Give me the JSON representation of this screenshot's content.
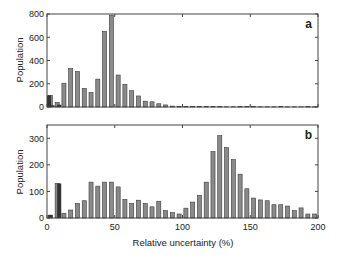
{
  "chart_data": [
    {
      "type": "bar",
      "panel_label": "a",
      "title": "",
      "xlabel": "",
      "ylabel": "Population",
      "xlim": [
        0,
        200
      ],
      "ylim": [
        0,
        800
      ],
      "yticks": [
        0,
        200,
        400,
        600,
        800
      ],
      "xticks": [
        0,
        50,
        100,
        150,
        200
      ],
      "show_xtick_labels": false,
      "grid": false,
      "bin_width": 5,
      "x": [
        0,
        5,
        10,
        15,
        20,
        25,
        30,
        35,
        40,
        45,
        50,
        55,
        60,
        65,
        70,
        75,
        80,
        85,
        90,
        95,
        100,
        105,
        110,
        115,
        120,
        125,
        130,
        135,
        140,
        145,
        150,
        155,
        160,
        165,
        170,
        175,
        180,
        185,
        190,
        195
      ],
      "values": [
        100,
        40,
        205,
        330,
        305,
        160,
        125,
        240,
        650,
        790,
        275,
        195,
        140,
        95,
        50,
        45,
        28,
        18,
        8,
        5,
        4,
        3,
        4,
        3,
        6,
        3,
        2,
        2,
        3,
        5,
        3,
        2,
        2,
        2,
        3,
        2,
        2,
        2,
        4,
        2
      ],
      "dark_bars": [
        {
          "x": 0,
          "value": 100
        },
        {
          "x": 2.5,
          "value": 15
        },
        {
          "x": 7.5,
          "value": 20
        }
      ]
    },
    {
      "type": "bar",
      "panel_label": "b",
      "title": "",
      "xlabel": "Relative uncertainty (%)",
      "ylabel": "Population",
      "xlim": [
        0,
        200
      ],
      "ylim": [
        0,
        350
      ],
      "yticks": [
        0,
        100,
        200,
        300
      ],
      "xticks": [
        0,
        50,
        100,
        150,
        200
      ],
      "show_xtick_labels": true,
      "grid": false,
      "bin_width": 5,
      "x": [
        0,
        5,
        10,
        15,
        20,
        25,
        30,
        35,
        40,
        45,
        50,
        55,
        60,
        65,
        70,
        75,
        80,
        85,
        90,
        95,
        100,
        105,
        110,
        115,
        120,
        125,
        130,
        135,
        140,
        145,
        150,
        155,
        160,
        165,
        170,
        175,
        180,
        185,
        190,
        195
      ],
      "values": [
        10,
        130,
        18,
        30,
        55,
        65,
        135,
        120,
        135,
        135,
        117,
        70,
        55,
        67,
        55,
        42,
        63,
        28,
        20,
        15,
        37,
        60,
        85,
        135,
        250,
        310,
        265,
        220,
        165,
        110,
        75,
        68,
        65,
        50,
        50,
        45,
        28,
        38,
        15,
        15
      ],
      "dark_bars": [
        {
          "x": 1,
          "value": 12
        },
        {
          "x": 7.5,
          "value": 130
        }
      ]
    }
  ],
  "panels": {
    "a": {
      "label": "a",
      "ylabel": "Population",
      "yticks": [
        "0",
        "200",
        "400",
        "600",
        "800"
      ]
    },
    "b": {
      "label": "b",
      "ylabel": "Population",
      "yticks": [
        "0",
        "100",
        "200",
        "300"
      ],
      "xticks": [
        "0",
        "50",
        "100",
        "150",
        "200"
      ],
      "xlabel": "Relative uncertainty (%)"
    }
  },
  "colors": {
    "bar_fill": "#8a8a8a",
    "bar_stroke": "#3a3a3a",
    "dark_bar": "#333333",
    "axis": "#444444"
  }
}
